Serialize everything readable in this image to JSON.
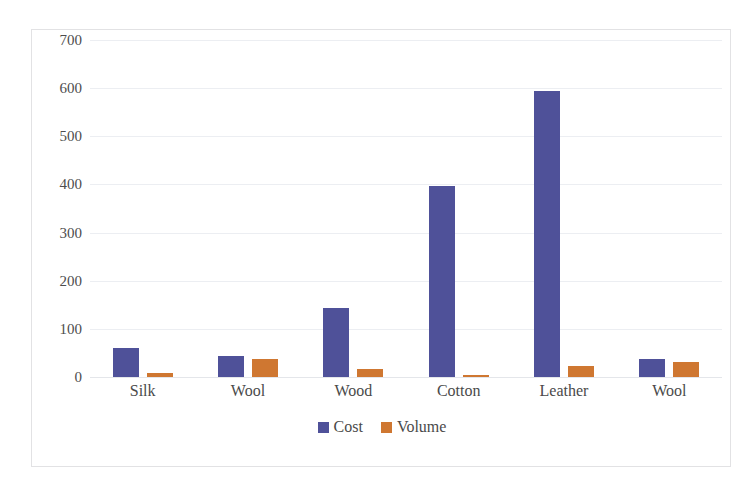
{
  "page": {
    "cut_off_header_text": "· · · · · · · · · · · · · · · · ·"
  },
  "legend": {
    "position": "bottom-center",
    "items": [
      {
        "label": "Cost",
        "color": "#4f5199",
        "icon": "square-swatch"
      },
      {
        "label": "Volume",
        "color": "#cf7731",
        "icon": "square-swatch"
      }
    ]
  },
  "chart_data": {
    "type": "bar",
    "title": "",
    "xlabel": "",
    "ylabel": "",
    "categories": [
      "Silk",
      "Wool",
      "Wood",
      "Cotton",
      "Leather",
      "Wool"
    ],
    "series": [
      {
        "name": "Cost",
        "color": "#4f5199",
        "values": [
          60,
          44,
          143,
          396,
          595,
          38
        ]
      },
      {
        "name": "Volume",
        "color": "#cf7731",
        "values": [
          8,
          37,
          16,
          5,
          23,
          31
        ]
      }
    ],
    "ylim": [
      0,
      700
    ],
    "yticks": [
      0,
      100,
      200,
      300,
      400,
      500,
      600,
      700
    ],
    "ytick_labels": [
      "0",
      "100",
      "200",
      "300",
      "400",
      "500",
      "600",
      "700"
    ],
    "grid": true,
    "grid_axis": "y",
    "legend_position": "bottom",
    "plot_background": "#ffffff",
    "grid_color": "#eceef2",
    "frame_border_color": "#e2e2e4"
  }
}
